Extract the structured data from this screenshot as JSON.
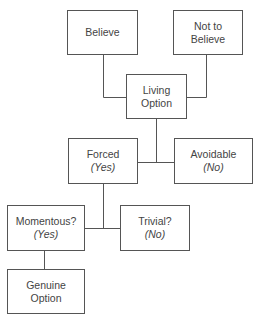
{
  "diagram": {
    "colors": {
      "stroke": "#555555",
      "text": "#444444",
      "background": "#ffffff"
    },
    "nodes": [
      {
        "id": "believe",
        "label": "Believe",
        "sub": ""
      },
      {
        "id": "not-to-believe",
        "label": "Not to",
        "label2": "Believe",
        "sub": ""
      },
      {
        "id": "living-option",
        "label": "Living",
        "label2": "Option",
        "sub": ""
      },
      {
        "id": "forced",
        "label": "Forced",
        "sub": "(Yes)"
      },
      {
        "id": "avoidable",
        "label": "Avoidable",
        "sub": "(No)"
      },
      {
        "id": "momentous",
        "label": "Momentous?",
        "sub": "(Yes)"
      },
      {
        "id": "trivial",
        "label": "Trivial?",
        "sub": "(No)"
      },
      {
        "id": "genuine-option",
        "label": "Genuine",
        "label2": "Option",
        "sub": ""
      }
    ],
    "edges": [
      {
        "from": "believe",
        "to": "living-option"
      },
      {
        "from": "not-to-believe",
        "to": "living-option"
      },
      {
        "from": "living-option",
        "to": "forced"
      },
      {
        "from": "living-option",
        "to": "avoidable"
      },
      {
        "from": "forced",
        "to": "momentous"
      },
      {
        "from": "forced",
        "to": "trivial"
      },
      {
        "from": "momentous",
        "to": "genuine-option"
      }
    ]
  }
}
